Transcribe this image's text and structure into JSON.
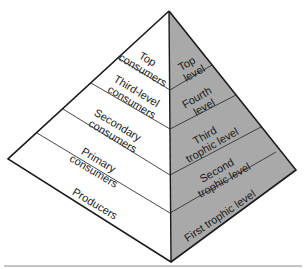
{
  "diagram": {
    "colors": {
      "left_face": "#ffffff",
      "right_face": "#a9a9a9",
      "outline": "#1a1a1a",
      "band_line": "#333333",
      "baseline": "#8a8a8a"
    },
    "consumer_levels": [
      {
        "lines": [
          "Top",
          "consumers"
        ]
      },
      {
        "lines": [
          "Third-level",
          "consumers"
        ]
      },
      {
        "lines": [
          "Secondary",
          "consumers"
        ]
      },
      {
        "lines": [
          "Primary",
          "consumers"
        ]
      },
      {
        "lines": [
          "Producers"
        ]
      }
    ],
    "trophic_levels": [
      {
        "lines": [
          "Top",
          "level"
        ]
      },
      {
        "lines": [
          "Fourth",
          "level"
        ]
      },
      {
        "lines": [
          "Third",
          "trophic level"
        ]
      },
      {
        "lines": [
          "Second",
          "trophic level"
        ]
      },
      {
        "lines": [
          "First trophic level"
        ]
      }
    ]
  }
}
